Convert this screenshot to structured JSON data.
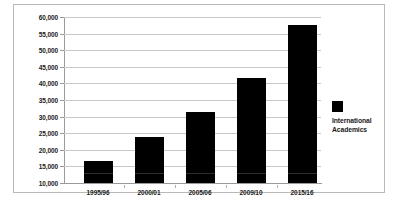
{
  "chart_data": {
    "type": "bar",
    "title": "",
    "xlabel": "",
    "ylabel": "",
    "categories": [
      "1995/96",
      "2000/01",
      "2005/06",
      "2009/10",
      "2015/16"
    ],
    "values": [
      16500,
      23800,
      31500,
      41500,
      57500
    ],
    "series": [
      {
        "name": "International Academics",
        "values": [
          16500,
          23800,
          31500,
          41500,
          57500
        ],
        "color": "#000000"
      }
    ],
    "ylim": [
      10000,
      60000
    ],
    "ytick_labels": [
      "60,000",
      "55,000",
      "50,000",
      "45,000",
      "40,000",
      "35,000",
      "30,000",
      "25,000",
      "20,000",
      "15,000",
      "10,000"
    ],
    "ytick_values": [
      60000,
      55000,
      50000,
      45000,
      40000,
      35000,
      30000,
      25000,
      20000,
      15000,
      10000
    ],
    "ytick_step": 5000,
    "grid": true,
    "legend_position": "right",
    "legend": [
      {
        "label": "International Academics",
        "label_line_1": "International",
        "label_line_2": "Academics",
        "color": "#000000"
      }
    ],
    "colors": {
      "bar": "#000000",
      "gridline": "#c8c8c8",
      "axis": "#9a9a9a",
      "border": "#b9b9b9",
      "background": "#ffffff",
      "text": "#1a1a1a"
    }
  }
}
